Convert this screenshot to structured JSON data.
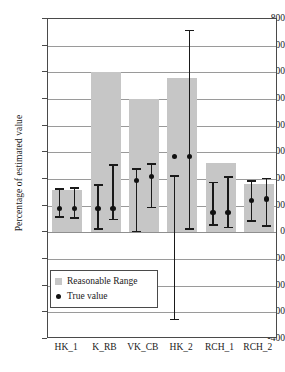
{
  "chart_data": {
    "type": "bar",
    "title": "",
    "xlabel": "",
    "ylabel": "Percentage of estimated value",
    "categories": [
      "HK_1",
      "K_RB",
      "VK_CB",
      "HK_2",
      "RCH_1",
      "RCH_2"
    ],
    "ylim": [
      -400,
      800
    ],
    "ytick_step": 100,
    "yticks": [
      800,
      700,
      600,
      500,
      400,
      300,
      200,
      100,
      0,
      -100,
      -200,
      -300,
      -400
    ],
    "ytick_labels": [
      "800",
      "700",
      "600",
      "500",
      "400",
      "300",
      "200",
      "100",
      "0",
      "-100",
      "-200",
      "-300",
      "-400"
    ],
    "grid": true,
    "legend_position": "lower-left-inside",
    "series": [
      {
        "name": "Reasonable Range",
        "type": "range-bar",
        "color": "#c6c6c6",
        "lower": [
          0,
          0,
          0,
          0,
          0,
          0
        ],
        "upper": [
          160,
          600,
          500,
          580,
          260,
          180
        ]
      },
      {
        "name": "True value",
        "type": "point-with-error",
        "color": "#111111",
        "points": [
          {
            "category": "HK_1",
            "index": 0,
            "value": 90,
            "low": 55,
            "high": 165
          },
          {
            "category": "HK_1",
            "index": 1,
            "value": 90,
            "low": 50,
            "high": 170
          },
          {
            "category": "K_RB",
            "index": 0,
            "value": 90,
            "low": 10,
            "high": 180
          },
          {
            "category": "K_RB",
            "index": 1,
            "value": 90,
            "low": 45,
            "high": 255
          },
          {
            "category": "VK_CB",
            "index": 0,
            "value": 195,
            "low": 0,
            "high": 240
          },
          {
            "category": "VK_CB",
            "index": 1,
            "value": 210,
            "low": 90,
            "high": 260
          },
          {
            "category": "HK_2",
            "index": 0,
            "value": 285,
            "low": -330,
            "high": 215
          },
          {
            "category": "HK_2",
            "index": 1,
            "value": 285,
            "low": 10,
            "high": 760
          },
          {
            "category": "RCH_1",
            "index": 0,
            "value": 75,
            "low": 25,
            "high": 190
          },
          {
            "category": "RCH_1",
            "index": 1,
            "value": 75,
            "low": 15,
            "high": 210
          },
          {
            "category": "RCH_2",
            "index": 0,
            "value": 120,
            "low": 40,
            "high": 195
          },
          {
            "category": "RCH_2",
            "index": 1,
            "value": 125,
            "low": 20,
            "high": 205
          }
        ]
      }
    ],
    "legend": [
      {
        "label": "Reasonable Range",
        "marker": "square",
        "color": "#c6c6c6"
      },
      {
        "label": "True value",
        "marker": "dot",
        "color": "#111111"
      }
    ]
  }
}
